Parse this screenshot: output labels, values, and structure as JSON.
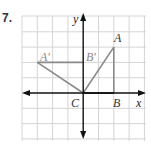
{
  "problem": {
    "number_label": "7."
  },
  "graph": {
    "axes": {
      "x_label": "x",
      "y_label": "y",
      "color": "#111111"
    },
    "grid": {
      "color": "#d4d4d4",
      "x_range": [
        -4,
        4
      ],
      "y_range": [
        -3,
        5
      ]
    },
    "figure_color": "#8a8a8a",
    "label_color_original": "#333333",
    "label_color_image": "#8a8a8a",
    "points": {
      "A": {
        "label": "A",
        "coords": [
          2,
          3
        ]
      },
      "B": {
        "label": "B",
        "coords": [
          2,
          0
        ]
      },
      "C": {
        "label": "C",
        "coords": [
          0,
          0
        ]
      },
      "A_prime": {
        "label": "A′",
        "coords": [
          -3,
          2
        ]
      },
      "B_prime": {
        "label": "B′",
        "coords": [
          0,
          2
        ]
      }
    }
  }
}
